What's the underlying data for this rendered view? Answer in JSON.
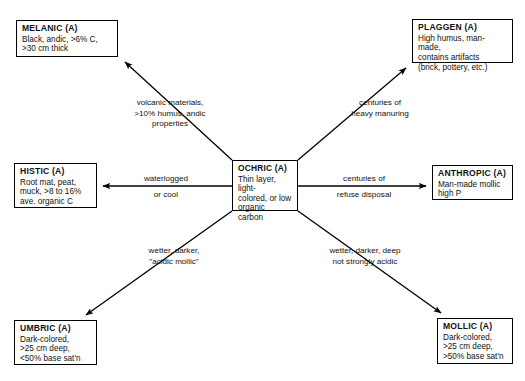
{
  "diagram": {
    "style": {
      "background": "#ffffff",
      "line_color": "#000000",
      "text_color": "#111111"
    },
    "center_node": {
      "id": "ochric",
      "title": "OCHRIC  (A)",
      "desc": "Thin layer, light-\ncolored, or low\norganic carbon"
    },
    "nodes": [
      {
        "id": "melanic",
        "title": "MELANIC  (A)",
        "desc": "Black,  andic, >6% C,\n>30 cm thick"
      },
      {
        "id": "plaggen",
        "title": "PLAGGEN  (A)",
        "desc": "High humus, man-made,\ncontains artifacts\n(brick, pottery, etc.)"
      },
      {
        "id": "histic",
        "title": "HISTIC  (A)",
        "desc": "Root mat, peat,\nmuck, >8 to 16%\nave. organic C"
      },
      {
        "id": "anthropic",
        "title": "ANTHROPIC  (A)",
        "desc": "Man-made mollic\nhigh P"
      },
      {
        "id": "umbric",
        "title": "UMBRIC (A)",
        "desc": "Dark-colored,\n>25 cm deep,\n<50% base sat'n"
      },
      {
        "id": "mollic",
        "title": "MOLLIC  (A)",
        "desc": "Dark-colored,\n>25 cm deep,\n>50% base sat'n"
      }
    ],
    "edges": [
      {
        "id": "ochric-to-melanic",
        "from": "ochric",
        "to": "melanic",
        "label": "volcanic materials,\n>10% humus, andic\nproperties"
      },
      {
        "id": "ochric-to-plaggen",
        "from": "ochric",
        "to": "plaggen",
        "label": "centuries of\nheavy manuring"
      },
      {
        "id": "ochric-to-histic",
        "from": "ochric",
        "to": "histic",
        "label_above": "waterlogged",
        "label_below": "or cool"
      },
      {
        "id": "ochric-to-anthropic",
        "from": "ochric",
        "to": "anthropic",
        "label_above": "centuries of",
        "label_below": "refuse disposal"
      },
      {
        "id": "ochric-to-umbric",
        "from": "ochric",
        "to": "umbric",
        "label": "wetter, darker,\n\"acidic mollic\""
      },
      {
        "id": "ochric-to-mollic",
        "from": "ochric",
        "to": "mollic",
        "label": "wetter, darker, deep\nnot strongly acidic"
      }
    ]
  }
}
